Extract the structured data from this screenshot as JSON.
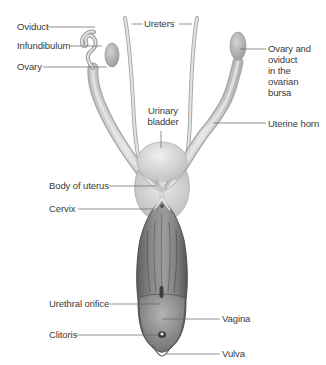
{
  "diagram": {
    "labels": {
      "oviduct": "Oviduct",
      "infundibulum": "Infundibulum",
      "ovary": "Ovary",
      "ureters": "Ureters",
      "ovary_oviduct_bursa": [
        "Ovary and",
        "oviduct",
        "in the",
        "ovarian",
        "bursa"
      ],
      "urinary_bladder": [
        "Urinary",
        "bladder"
      ],
      "uterine_horn": "Uterine horn",
      "body_of_uterus": "Body of uterus",
      "cervix": "Cervix",
      "urethral_orifice": "Urethral orifice",
      "vagina": "Vagina",
      "clitoris": "Clitoris",
      "vulva": "Vulva"
    },
    "colors": {
      "background": "#ffffff",
      "label_text": "#3a3a3a",
      "leader_line": "#555555",
      "tissue_light": "#d9d9d9",
      "tissue_mid": "#bdbdbd",
      "tissue_dark": "#6e6e6e",
      "vagina_lumen": "#7a7a7a"
    }
  }
}
